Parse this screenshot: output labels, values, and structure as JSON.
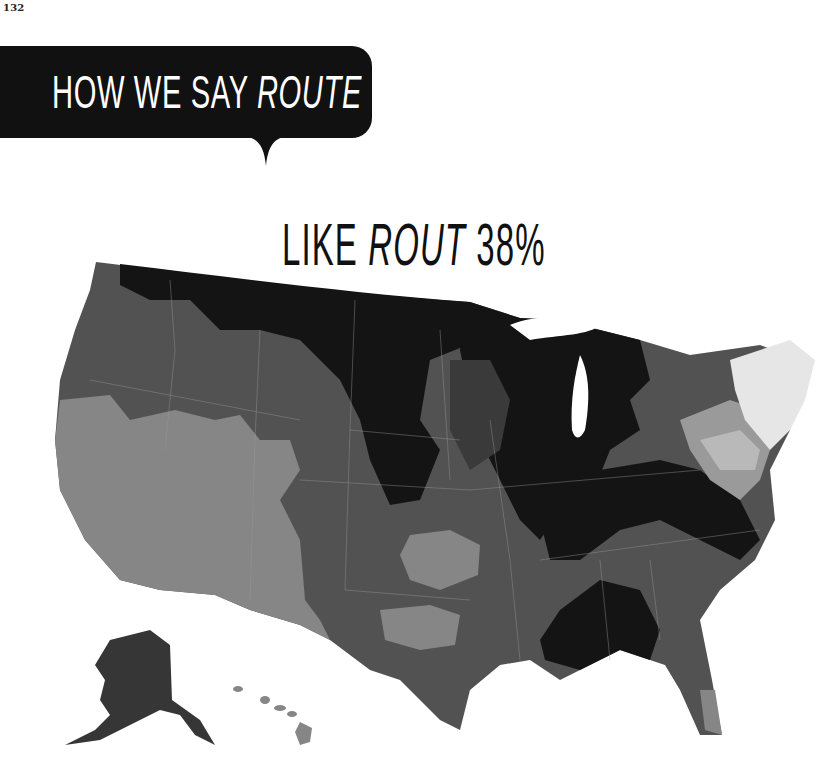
{
  "page": {
    "number": "132"
  },
  "banner": {
    "prefix": "HOW WE SAY ",
    "word": "ROUTE"
  },
  "map": {
    "title_prefix": "LIKE ",
    "title_word": "ROUT",
    "title_percent": " 38%",
    "subject": "Pronunciation of 'route' like 'rout' across the United States",
    "national_share": "38%",
    "legend_shading": {
      "highest": "#141414",
      "high": "#363636",
      "medium": "#525252",
      "low": "#868686",
      "lower": "#b9b9b9",
      "lowest": "#e6e6e6"
    },
    "regions": [
      {
        "name": "Northern Plains & Upper Midwest",
        "shade": "highest"
      },
      {
        "name": "Pacific Northwest",
        "shade": "medium"
      },
      {
        "name": "California & Nevada & Arizona",
        "shade": "low"
      },
      {
        "name": "Rocky Mountains",
        "shade": "medium"
      },
      {
        "name": "Ohio Valley & Great Lakes",
        "shade": "highest"
      },
      {
        "name": "Deep South (Mississippi/Alabama)",
        "shade": "highest"
      },
      {
        "name": "Texas & Southern Plains",
        "shade": "medium"
      },
      {
        "name": "Mid-Atlantic",
        "shade": "lower"
      },
      {
        "name": "New England",
        "shade": "lowest"
      },
      {
        "name": "Alaska",
        "shade": "high"
      },
      {
        "name": "Hawaii",
        "shade": "low"
      }
    ]
  }
}
